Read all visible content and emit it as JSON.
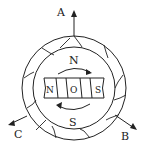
{
  "diagram": {
    "terminals": [
      {
        "id": "A",
        "label": "A"
      },
      {
        "id": "B",
        "label": "B"
      },
      {
        "id": "C",
        "label": "C"
      }
    ],
    "stator_poles": {
      "top": "N",
      "bottom": "S"
    },
    "rotor": {
      "left_pole": "N",
      "center": "O",
      "right_pole": "S"
    },
    "colors": {
      "ink": "#222222",
      "background": "#ffffff"
    }
  }
}
